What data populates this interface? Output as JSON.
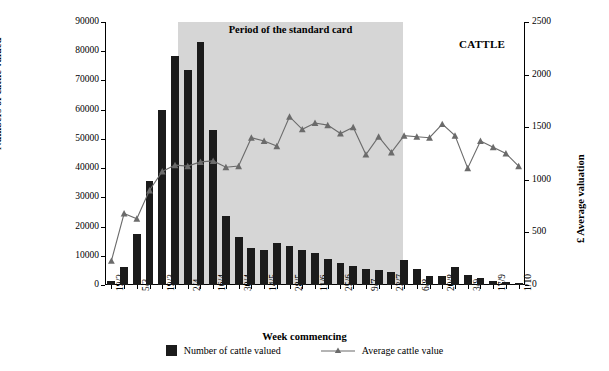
{
  "chart_data": {
    "type": "bar",
    "title": "",
    "band_label": "Period of the standard card",
    "corner_label": "CATTLE",
    "xlabel": "Week commencing",
    "ylabel": "Numbers of cattle valued",
    "y2label": "£ Average valuation",
    "ylim": [
      0,
      90000
    ],
    "y2lim": [
      0,
      2500
    ],
    "yticks": [
      0,
      10000,
      20000,
      30000,
      40000,
      50000,
      60000,
      70000,
      80000,
      90000
    ],
    "y2ticks": [
      0,
      500,
      1000,
      1500,
      2000,
      2500
    ],
    "grid": false,
    "legend_position": "bottom",
    "categories": [
      "19/2",
      "26/2",
      "5/3",
      "12/3",
      "19/3",
      "26/3",
      "2/4",
      "9/4",
      "16/4",
      "23/4",
      "30/4",
      "7/5",
      "14/5",
      "21/5",
      "28/5",
      "4/6",
      "11/6",
      "18/6",
      "25/6",
      "2/7",
      "9/7",
      "16/7",
      "23/7",
      "30/7",
      "6/8",
      "13/8",
      "20/8",
      "27/8",
      "3/9",
      "10/9",
      "17/9",
      "24/9",
      "1/10"
    ],
    "xtick_labels": [
      "19/2",
      "",
      "5/3",
      "",
      "19/3",
      "",
      "2/4",
      "",
      "16/4",
      "",
      "30/4",
      "",
      "14/5",
      "",
      "28/5",
      "",
      "11/6",
      "",
      "25/6",
      "",
      "9/7",
      "",
      "23/7",
      "",
      "6/8",
      "",
      "20/8",
      "",
      "3/9",
      "",
      "17/9",
      "",
      "1/10"
    ],
    "series": [
      {
        "name": "Number of cattle valued",
        "type": "bar",
        "axis": "left",
        "color": "#1b1b1b",
        "values": [
          1500,
          6000,
          17500,
          35500,
          60000,
          78500,
          73500,
          83000,
          53000,
          23500,
          16500,
          12500,
          12000,
          14500,
          13500,
          12000,
          11000,
          9000,
          7500,
          6500,
          5500,
          5000,
          4500,
          8500,
          5500,
          3000,
          3000,
          6000,
          3500,
          2500,
          1500,
          1000,
          700
        ]
      },
      {
        "name": "Average cattle value",
        "type": "line",
        "axis": "right",
        "color": "#6b6b6b",
        "marker": "triangle",
        "values": [
          230,
          680,
          630,
          900,
          1080,
          1140,
          1130,
          1170,
          1180,
          1120,
          1130,
          1400,
          1370,
          1320,
          1600,
          1480,
          1540,
          1520,
          1440,
          1500,
          1240,
          1410,
          1260,
          1420,
          1410,
          1400,
          1530,
          1420,
          1110,
          1370,
          1310,
          1250,
          1130
        ]
      }
    ],
    "shaded_band": {
      "label": "Period of the standard card",
      "start_category": "12/3",
      "end_category": "23/7"
    },
    "legend": [
      {
        "label": "Number of cattle valued",
        "marker": "square",
        "color": "#1b1b1b"
      },
      {
        "label": "Average cattle value",
        "marker": "line-triangle",
        "color": "#6b6b6b"
      }
    ]
  }
}
